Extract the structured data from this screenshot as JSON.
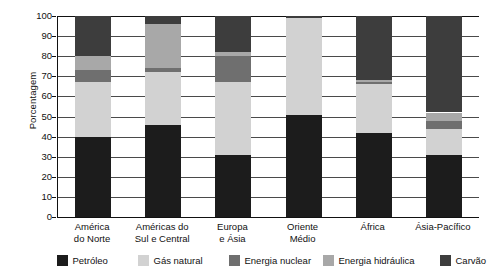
{
  "chart_data": {
    "type": "bar",
    "subtype": "stacked-bar-100",
    "title": "",
    "xlabel": "",
    "ylabel": "Porcentagem",
    "ylim": [
      0,
      100
    ],
    "ytick_step": 10,
    "yticks": [
      100,
      90,
      80,
      70,
      60,
      50,
      40,
      30,
      20,
      10,
      0
    ],
    "grid": true,
    "legend_position": "bottom",
    "categories": [
      "América do Norte",
      "Américas do Sul e Central",
      "Europa e Ásia",
      "Oriente Médio",
      "África",
      "Ásia-Pacífico"
    ],
    "category_lines": [
      [
        "América",
        "do Norte"
      ],
      [
        "Américas do",
        "Sul e Central"
      ],
      [
        "Europa",
        "e Ásia"
      ],
      [
        "Oriente",
        "Médio"
      ],
      [
        "África",
        ""
      ],
      [
        "Ásia-Pacífico",
        ""
      ]
    ],
    "series": [
      {
        "name": "Petróleo",
        "color": "#1c1c1c",
        "values": [
          40,
          46,
          31,
          51,
          42,
          31
        ]
      },
      {
        "name": "Gás natural",
        "color": "#d2d2d2",
        "values": [
          27,
          26,
          36,
          48,
          24,
          13
        ]
      },
      {
        "name": "Energia nuclear",
        "color": "#6f6f6f",
        "values": [
          6,
          2,
          13,
          0,
          1,
          4
        ]
      },
      {
        "name": "Energia hidráulica",
        "color": "#a8a8a8",
        "values": [
          7,
          22,
          2,
          0,
          1,
          4
        ]
      },
      {
        "name": "Carvão",
        "color": "#3d3d3d",
        "values": [
          20,
          4,
          18,
          1,
          32,
          48
        ]
      }
    ]
  },
  "axis": {
    "y_title": "Porcentagem"
  },
  "legend": {
    "items": [
      {
        "label": "Petróleo",
        "color": "#1c1c1c"
      },
      {
        "label": "Gás natural",
        "color": "#d2d2d2"
      },
      {
        "label": "Energia nuclear",
        "color": "#6f6f6f"
      },
      {
        "label": "Energia hidráulica",
        "color": "#a8a8a8"
      },
      {
        "label": "Carvão",
        "color": "#3d3d3d"
      }
    ]
  }
}
